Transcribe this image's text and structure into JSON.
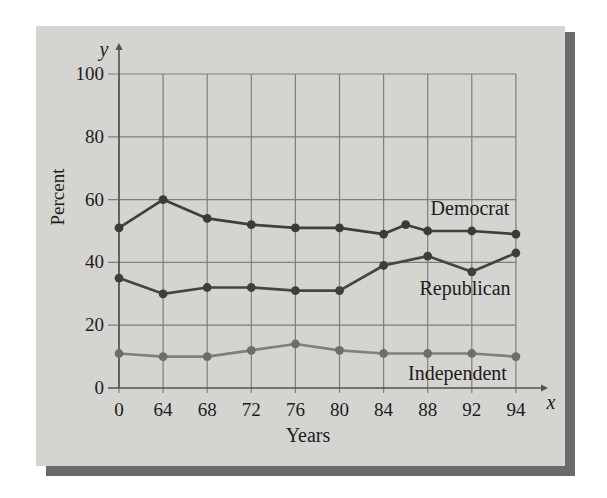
{
  "figure": {
    "y_axis_title": "Percent",
    "x_axis_title": "Years",
    "y_variable": "y",
    "x_variable": "x",
    "panel_color": "#d4d4d0",
    "shadow_color": "#6a6a6a",
    "grid_color": "#7f7f7a",
    "axis_color": "#52524e",
    "text_color": "#1c1c1c"
  },
  "chart_data": {
    "type": "line",
    "title": "",
    "xlabel": "Years",
    "ylabel": "Percent",
    "x_ticks": [
      "0",
      "64",
      "68",
      "72",
      "76",
      "80",
      "84",
      "88",
      "92",
      "94"
    ],
    "y_ticks": [
      "0",
      "20",
      "40",
      "60",
      "80",
      "100"
    ],
    "ylim": [
      0,
      100
    ],
    "grid": true,
    "legend_position": "inline-labels",
    "series": [
      {
        "name": "Democrat",
        "color": "#3f3f3d",
        "marker_color": "#3a3a38",
        "years": [
          0,
          64,
          68,
          72,
          76,
          80,
          84,
          86,
          88,
          92,
          94
        ],
        "values": [
          51,
          60,
          54,
          52,
          51,
          51,
          49,
          52,
          50,
          50,
          49
        ]
      },
      {
        "name": "Republican",
        "color": "#454541",
        "marker_color": "#3e3e3a",
        "years": [
          0,
          64,
          68,
          72,
          76,
          80,
          84,
          88,
          92,
          94
        ],
        "values": [
          35,
          30,
          32,
          32,
          31,
          31,
          39,
          42,
          37,
          43
        ]
      },
      {
        "name": "Independent",
        "color": "#80807a",
        "marker_color": "#6e6e69",
        "years": [
          0,
          64,
          68,
          72,
          76,
          80,
          84,
          88,
          92,
          94
        ],
        "values": [
          11,
          10,
          10,
          12,
          14,
          12,
          11,
          11,
          11,
          10
        ]
      }
    ]
  }
}
